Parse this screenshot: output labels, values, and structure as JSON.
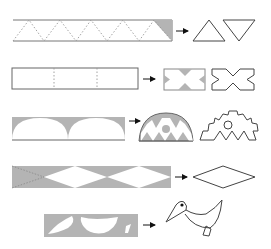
{
  "diagram": {
    "title": "",
    "colors": {
      "background": "#ffffff",
      "stroke": "#555555",
      "fill_shaded": "#b4b4b4",
      "dash": "#888888",
      "arrow": "#111111"
    },
    "rows": [
      {
        "id": "row-1",
        "input": "strip-zigzag-dashed-triangles",
        "output": [
          "triangle-up",
          "triangle-down"
        ]
      },
      {
        "id": "row-2",
        "input": "strip-three-panels-dashed-folds",
        "output": [
          "notched-rectangle-shaded",
          "x-shape-outline"
        ]
      },
      {
        "id": "row-3",
        "input": "strip-two-semicircles-shaded",
        "output": [
          "semicircle-with-triangles-and-dot",
          "gear-like-outline-with-circle"
        ]
      },
      {
        "id": "row-4",
        "input": "strip-diamonds-shaded",
        "output": [
          "diamond-outline"
        ]
      },
      {
        "id": "row-5",
        "input": "strip-bird-parts-shaded",
        "output": [
          "bird-outline"
        ]
      }
    ]
  }
}
